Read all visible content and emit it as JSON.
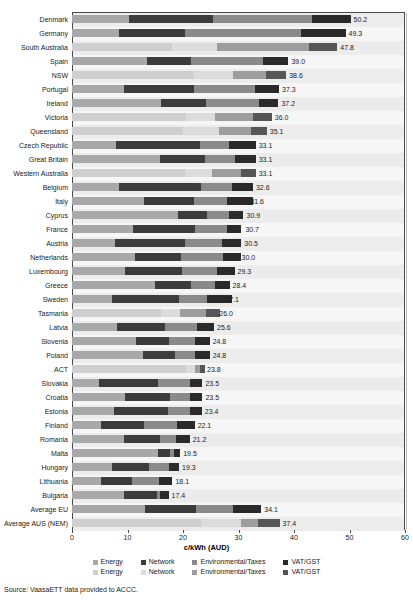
{
  "chart_data": {
    "type": "bar",
    "orientation": "horizontal",
    "stacked": true,
    "title": "",
    "xlabel": "c/kWh (AUD)",
    "ylabel": "",
    "xlim": [
      0,
      60
    ],
    "xticks": [
      0,
      10,
      20,
      30,
      40,
      50,
      60
    ],
    "grid": true,
    "legend_position": "bottom",
    "legend_rows": [
      {
        "group": "european",
        "entries": [
          {
            "name": "Energy",
            "color": "#a8a8a8"
          },
          {
            "name": "Network",
            "color": "#3c3c3c"
          },
          {
            "name": "Environmental/Taxes",
            "color": "#8a8a8a"
          },
          {
            "name": "VAT/GST",
            "color": "#2a2a2a"
          }
        ]
      },
      {
        "group": "australian",
        "entries": [
          {
            "name": "Energy",
            "color": "#cfcfcf"
          },
          {
            "name": "Network",
            "color": "#dcdcdc"
          },
          {
            "name": "Environmental/Taxes",
            "color": "#9d9d9d"
          },
          {
            "name": "VAT/GST",
            "color": "#565656"
          }
        ]
      }
    ],
    "series": [
      {
        "name": "Energy",
        "values": [
          10.2,
          8.4,
          18.0,
          13.5,
          22.0,
          9.4,
          16.0,
          20.5,
          20.0,
          8.0,
          15.8,
          20.4,
          8.4,
          13.0,
          19.1,
          11.0,
          7.8,
          11.4,
          9.6,
          15.0,
          7.2,
          16.0,
          8.1,
          11.5,
          12.8,
          20.6,
          4.9,
          9.6,
          7.6,
          5.3,
          9.3,
          15.5,
          7.2,
          5.3,
          9.4,
          13.1,
          23.3
        ]
      },
      {
        "name": "Network",
        "values": [
          15.2,
          12.0,
          8.1,
          8.0,
          7.0,
          12.6,
          8.1,
          5.2,
          6.4,
          15.0,
          8.2,
          4.8,
          14.9,
          9.0,
          5.2,
          11.1,
          12.6,
          8.2,
          10.3,
          6.5,
          12.1,
          3.5,
          8.7,
          6.0,
          5.8,
          1.6,
          10.6,
          8.1,
          9.7,
          7.6,
          6.6,
          2.2,
          6.7,
          5.6,
          5.9,
          9.3,
          7.1
        ]
      },
      {
        "name": "Environmental/Taxes",
        "values": [
          17.8,
          20.8,
          16.6,
          12.9,
          6.0,
          11.0,
          9.6,
          7.0,
          5.9,
          5.2,
          5.3,
          5.3,
          5.6,
          5.9,
          3.9,
          5.9,
          6.6,
          7.6,
          6.2,
          4.2,
          5.1,
          4.6,
          5.7,
          4.6,
          3.5,
          0.9,
          5.7,
          3.6,
          3.9,
          6.1,
          2.9,
          0.7,
          3.6,
          4.8,
          0.6,
          6.6,
          3.2
        ]
      },
      {
        "name": "VAT/GST",
        "values": [
          7.0,
          8.1,
          5.1,
          4.6,
          3.6,
          4.3,
          3.5,
          3.3,
          2.8,
          4.9,
          3.8,
          2.6,
          3.7,
          4.7,
          2.7,
          2.5,
          3.5,
          3.3,
          3.2,
          2.7,
          4.4,
          2.5,
          3.1,
          2.7,
          2.7,
          0.8,
          2.3,
          2.2,
          2.2,
          3.1,
          2.4,
          1.1,
          1.8,
          2.4,
          1.5,
          5.1,
          3.8
        ]
      }
    ],
    "categories": [
      "Denmark",
      "Germany",
      "South Australia",
      "Spain",
      "NSW",
      "Portugal",
      "Ireland",
      "Victoria",
      "Queensland",
      "Czech Republic",
      "Great Britain",
      "Western Australia",
      "Belgium",
      "Italy",
      "Cyprus",
      "France",
      "Austria",
      "Netherlands",
      "Luxembourg",
      "Greece",
      "Sweden",
      "Tasmania",
      "Latvia",
      "Slovenia",
      "Poland",
      "ACT",
      "Slovakia",
      "Croatia",
      "Estonia",
      "Finland",
      "Romania",
      "Malta",
      "Hungary",
      "Lithuania",
      "Bulgaria",
      "Average EU",
      "Average AUS (NEM)"
    ],
    "totals": [
      50.2,
      49.3,
      47.8,
      39.0,
      38.6,
      37.3,
      37.2,
      36.0,
      35.1,
      33.1,
      33.1,
      33.1,
      32.6,
      31.6,
      30.9,
      30.7,
      30.5,
      30.0,
      29.3,
      28.4,
      27.1,
      26.0,
      25.6,
      24.8,
      24.8,
      23.8,
      23.5,
      23.5,
      23.4,
      22.1,
      21.2,
      19.5,
      19.3,
      18.1,
      17.4,
      34.1,
      37.4
    ],
    "value_labels": [
      "50.2",
      "49.3",
      "47.8",
      "39.0",
      "38.6",
      "37.3",
      "37.2",
      "36.0",
      "35.1",
      "33.1",
      "33.1",
      "33.1",
      "32.6",
      "31.6",
      "30.9",
      "30.7",
      "30.5",
      "30.0",
      "29.3",
      "28.4",
      "27.1",
      "26.0",
      "25.6",
      "24.8",
      "24.8",
      "23.8",
      "23.5",
      "23.5",
      "23.4",
      "22.1",
      "21.2",
      "19.5",
      "19.3",
      "18.1",
      "17.4",
      "34.1",
      "37.4"
    ],
    "australian_rows": [
      "South Australia",
      "NSW",
      "Victoria",
      "Queensland",
      "Western Australia",
      "Tasmania",
      "ACT",
      "Average AUS (NEM)"
    ]
  },
  "source": {
    "text": "Source: VaasaETT data provided to ACCC."
  }
}
